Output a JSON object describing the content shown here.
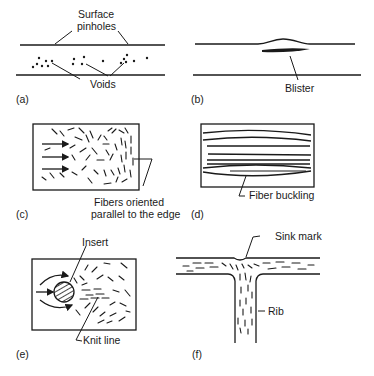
{
  "figure": {
    "panels": [
      {
        "id": "a",
        "panel_label": "(a)",
        "labels": [
          "Surface",
          "pinholes",
          "Voids"
        ]
      },
      {
        "id": "b",
        "panel_label": "(b)",
        "labels": [
          "Blister"
        ]
      },
      {
        "id": "c",
        "panel_label": "(c)",
        "labels": [
          "Fibers oriented",
          "parallel to the edge"
        ]
      },
      {
        "id": "d",
        "panel_label": "(d)",
        "labels": [
          "Fiber buckling"
        ]
      },
      {
        "id": "e",
        "panel_label": "(e)",
        "labels": [
          "Insert",
          "Knit line"
        ]
      },
      {
        "id": "f",
        "panel_label": "(f)",
        "labels": [
          "Sink mark",
          "Rib"
        ]
      }
    ]
  },
  "colors": {
    "ink": "#1a1a1a",
    "background": "#ffffff"
  }
}
